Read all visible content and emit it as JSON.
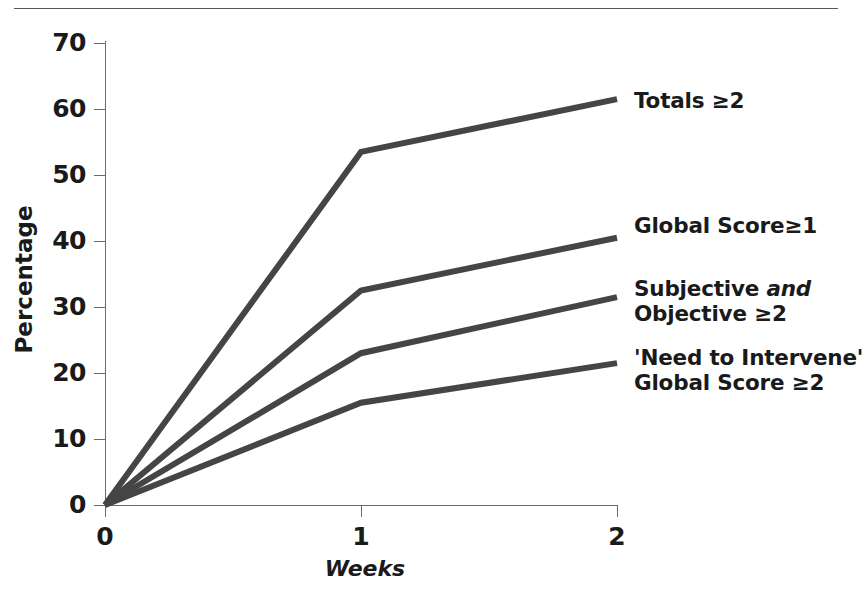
{
  "figure": {
    "has_top_rule": true,
    "line_color": "#454545",
    "axis_color": "#6b6b6b",
    "text_color": "#1a1a1a",
    "background": "#ffffff"
  },
  "chart_data": {
    "type": "line",
    "title": "",
    "subtitle": "",
    "xlabel": "Weeks",
    "ylabel": "Percentage",
    "x": [
      0,
      1,
      2
    ],
    "xlim": [
      0,
      2
    ],
    "ylim": [
      0,
      70
    ],
    "xticks": [
      "0",
      "1",
      "2"
    ],
    "yticks": [
      "0",
      "10",
      "20",
      "30",
      "40",
      "50",
      "60",
      "70"
    ],
    "grid": false,
    "legend_position": "right-inline-end-of-line",
    "series": [
      {
        "name": "Totals ≥2",
        "label_lines": [
          "Totals ≥2"
        ],
        "values": [
          0,
          53.5,
          61.5
        ]
      },
      {
        "name": "Global Score≥1",
        "label_lines": [
          "Global Score≥1"
        ],
        "values": [
          0,
          32.5,
          40.5
        ]
      },
      {
        "name": "Subjective and Objective ≥2",
        "label_lines": [
          "Subjective and",
          "Objective ≥2"
        ],
        "values": [
          0,
          23,
          31.5
        ]
      },
      {
        "name": "'Need to Intervene' Global Score ≥2",
        "label_lines": [
          "'Need to Intervene'",
          "Global Score ≥2"
        ],
        "values": [
          0,
          15.5,
          21.5
        ]
      }
    ]
  },
  "axes": {
    "y_tick_labels": [
      "70",
      "60",
      "50",
      "40",
      "30",
      "20",
      "10",
      "0"
    ],
    "x_tick_labels": [
      "0",
      "1",
      "2"
    ],
    "y_axis_title": "Percentage",
    "x_axis_title": "Weeks"
  },
  "labels": {
    "totals": {
      "line1": "Totals ≥2",
      "line2": ""
    },
    "global_score_1": {
      "line1": "Global Score≥1",
      "line2": ""
    },
    "subjective_objective": {
      "line1_a": "Subjective ",
      "line1_b": "and",
      "line2": "Objective ≥2"
    },
    "need_to_intervene": {
      "line1": "'Need to Intervene'",
      "line2": "Global Score ≥2"
    }
  }
}
